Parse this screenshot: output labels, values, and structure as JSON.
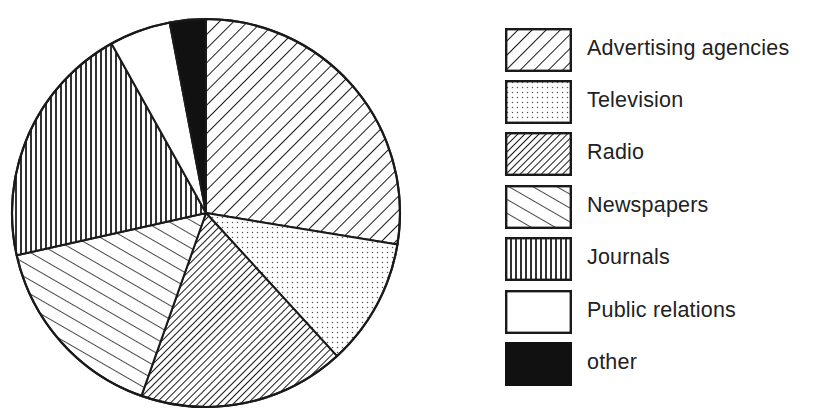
{
  "chart_data": {
    "type": "pie",
    "title": "",
    "start_angle_deg": 0,
    "direction": "clockwise",
    "categories": [
      "Advertising agencies",
      "Television",
      "Radio",
      "Newspapers",
      "Journals",
      "Public relations",
      "other"
    ],
    "values": [
      27.6,
      10.6,
      17.2,
      16.1,
      20.4,
      5.1,
      3.0
    ],
    "unit": "percent (estimated from slice angles)",
    "legend_position": "right",
    "slice_patterns": [
      "diagonal-forward-sparse",
      "dots",
      "diagonal-forward-dense",
      "diagonal-back-sparse",
      "vertical-lines",
      "solid-white",
      "solid-black"
    ]
  },
  "legend": {
    "items": [
      {
        "label": "Advertising agencies",
        "pattern": "adv"
      },
      {
        "label": "Television",
        "pattern": "tv"
      },
      {
        "label": "Radio",
        "pattern": "radio"
      },
      {
        "label": "Newspapers",
        "pattern": "news"
      },
      {
        "label": "Journals",
        "pattern": "journals"
      },
      {
        "label": "Public relations",
        "pattern": "pr"
      },
      {
        "label": "other",
        "pattern": "other"
      }
    ]
  },
  "colors": {
    "ink": "#1a1a1a",
    "text": "#222222",
    "background": "#ffffff"
  }
}
